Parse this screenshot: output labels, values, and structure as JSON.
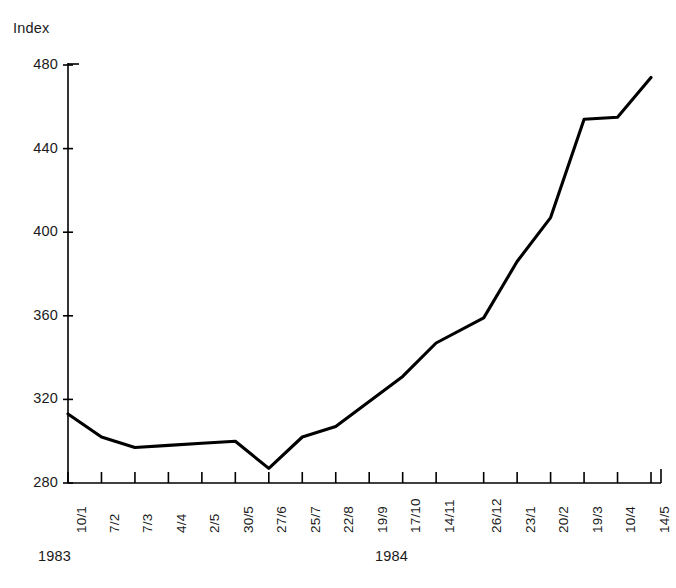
{
  "chart_data": {
    "type": "line",
    "title": "",
    "ylabel": "Index",
    "xlabel": "",
    "ylim": [
      280,
      480
    ],
    "yticks": [
      280,
      320,
      360,
      400,
      440,
      480
    ],
    "grid": false,
    "legend": null,
    "categories": [
      "10/1",
      "7/2",
      "7/3",
      "4/4",
      "2/5",
      "30/5",
      "27/6",
      "25/7",
      "22/8",
      "19/9",
      "17/10",
      "14/11",
      "26/12",
      "23/1",
      "20/2",
      "19/3",
      "10/4",
      "14/5"
    ],
    "values": [
      313,
      302,
      297,
      298,
      299,
      300,
      287,
      302,
      307,
      319,
      331,
      347,
      359,
      386,
      407,
      454,
      455,
      474
    ],
    "series": [
      {
        "name": "Index",
        "values": [
          313,
          302,
          297,
          298,
          299,
          300,
          287,
          302,
          307,
          319,
          331,
          347,
          359,
          386,
          407,
          454,
          455,
          474
        ]
      }
    ],
    "annotations": [
      {
        "text": "1983",
        "role": "year-group-start"
      },
      {
        "text": "1984",
        "role": "year-group-end"
      }
    ],
    "line_color": "#000000",
    "axis_color": "#000000"
  },
  "axis": {
    "y_title": "Index",
    "y_tick_labels": [
      "480",
      "440",
      "400",
      "360",
      "320",
      "280"
    ],
    "x_tick_labels": [
      "10/1",
      "7/2",
      "7/3",
      "4/4",
      "2/5",
      "30/5",
      "27/6",
      "25/7",
      "22/8",
      "19/9",
      "17/10",
      "14/11",
      "26/12",
      "23/1",
      "20/2",
      "19/3",
      "10/4",
      "14/5"
    ]
  },
  "years": {
    "first": "1983",
    "second": "1984"
  }
}
